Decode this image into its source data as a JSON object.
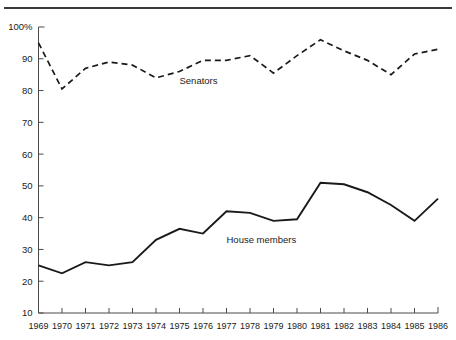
{
  "chart_data": {
    "type": "line",
    "title": "",
    "xlabel": "",
    "ylabel": "",
    "grid": false,
    "legend_position": "inline-annotation",
    "x": [
      1969,
      1970,
      1971,
      1972,
      1973,
      1974,
      1975,
      1976,
      1977,
      1978,
      1979,
      1980,
      1981,
      1982,
      1983,
      1984,
      1985,
      1986
    ],
    "xtick_labels": [
      "1969",
      "1970",
      "1971",
      "1972",
      "1973",
      "1974",
      "1975",
      "1976",
      "1977",
      "1978",
      "1979",
      "1980",
      "1981",
      "1982",
      "1983",
      "1984",
      "1985",
      "1986"
    ],
    "ytick_labels": [
      "10",
      "20",
      "30",
      "40",
      "50",
      "60",
      "70",
      "80",
      "90",
      "100%"
    ],
    "yticks": [
      10,
      20,
      30,
      40,
      50,
      60,
      70,
      80,
      90,
      100
    ],
    "ylim": [
      10,
      100
    ],
    "xlim": [
      1969,
      1986
    ],
    "series": [
      {
        "name": "Senators",
        "style": "dashed",
        "label_x": 1975,
        "label_y": 82,
        "values": [
          95,
          80.5,
          87,
          89,
          88,
          84,
          86,
          89.5,
          89.5,
          91,
          85.5,
          91,
          96,
          92.5,
          89.5,
          85,
          91.5,
          93
        ]
      },
      {
        "name": "House members",
        "style": "solid",
        "label_x": 1977,
        "label_y": 32,
        "values": [
          25,
          22.5,
          26,
          25,
          26,
          33,
          36.5,
          35,
          42,
          41.5,
          39,
          39.5,
          51,
          50.5,
          48,
          44,
          39,
          46
        ]
      }
    ]
  },
  "colors": {
    "line": "#1a1a1a",
    "axis": "#4a4a4a",
    "rule": "#3a3a3a",
    "background": "#ffffff"
  }
}
